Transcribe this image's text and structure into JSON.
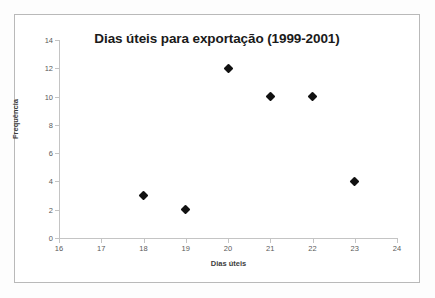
{
  "chart_data": {
    "type": "scatter",
    "title": "Dias úteis para exportação (1999-2001)",
    "xlabel": "Dias úteis",
    "ylabel": "Frequência",
    "xlim": [
      16,
      24
    ],
    "ylim": [
      0,
      14
    ],
    "xticks": [
      16,
      17,
      18,
      19,
      20,
      21,
      22,
      23,
      24
    ],
    "yticks": [
      0,
      2,
      4,
      6,
      8,
      10,
      12,
      14
    ],
    "grid": false,
    "legend": null,
    "marker": "diamond",
    "marker_color": "#111111",
    "points": [
      {
        "x": 18,
        "y": 3
      },
      {
        "x": 19,
        "y": 2
      },
      {
        "x": 20,
        "y": 12
      },
      {
        "x": 21,
        "y": 10
      },
      {
        "x": 22,
        "y": 10
      },
      {
        "x": 23,
        "y": 4
      }
    ]
  },
  "colors": {
    "page_background": "#fdfdfd",
    "plot_background": "#ffffff",
    "frame_border": "#b9b9b9",
    "axis_line": "#c4c4c4",
    "tick_label": "#5a5a5a",
    "axis_title": "#3d3d3d",
    "title": "#1a1a1a"
  }
}
